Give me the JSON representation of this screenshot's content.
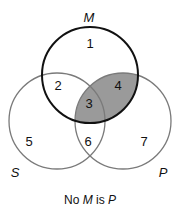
{
  "diagram": {
    "type": "venn-3",
    "sets": {
      "M": {
        "label": "M",
        "cx": 90,
        "cy": 75,
        "r": 48,
        "stroke": "#111111",
        "stroke_width": 2
      },
      "S": {
        "label": "S",
        "cx": 57,
        "cy": 121,
        "r": 48,
        "stroke": "#7a7a7a",
        "stroke_width": 1.3
      },
      "P": {
        "label": "P",
        "cx": 123,
        "cy": 121,
        "r": 48,
        "stroke": "#7a7a7a",
        "stroke_width": 1.3
      }
    },
    "shaded_regions": [
      "3",
      "4"
    ],
    "shade_color": "#9a9a9a",
    "regions": [
      {
        "id": "1",
        "label": "1",
        "x": 90,
        "y": 43
      },
      {
        "id": "2",
        "label": "2",
        "x": 58,
        "y": 85
      },
      {
        "id": "3",
        "label": "3",
        "x": 89,
        "y": 103
      },
      {
        "id": "4",
        "label": "4",
        "x": 118,
        "y": 85
      },
      {
        "id": "5",
        "label": "5",
        "x": 29,
        "y": 141
      },
      {
        "id": "6",
        "label": "6",
        "x": 88,
        "y": 141
      },
      {
        "id": "7",
        "label": "7",
        "x": 144,
        "y": 141
      }
    ],
    "set_labels": {
      "M": {
        "text": "M",
        "x": 89,
        "y": 17
      },
      "S": {
        "text": "S",
        "x": 15,
        "y": 172
      },
      "P": {
        "text": "P",
        "x": 163,
        "y": 172
      }
    },
    "caption": {
      "pre": "No ",
      "subject": "M",
      "mid": " is ",
      "predicate": "P"
    }
  }
}
